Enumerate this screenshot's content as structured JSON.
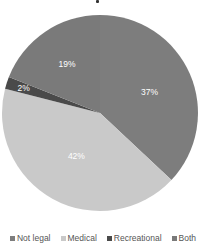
{
  "chart_data": {
    "type": "pie",
    "title": "",
    "categories": [
      "Not legal",
      "Medical",
      "Recreational",
      "Both"
    ],
    "values": [
      37,
      42,
      2,
      19
    ],
    "labels": [
      "37%",
      "42%",
      "2%",
      "19%"
    ],
    "colors": [
      "#7d7d7d",
      "#c9c9c9",
      "#4a4a4a",
      "#7a7a7a"
    ],
    "start_angle_deg": 0,
    "direction": "clockwise",
    "legend_position": "bottom",
    "data_labels": "inside",
    "series_mapping_note": "Medical (lightest) and Recreational (darkest) read directly from tone. Not legal vs. Both is inferred from clockwise legend order — the two slices are nearly identical mid-gray with no visible boundary, and the legend swatches are too small to distinguish them."
  },
  "legend": {
    "items": [
      {
        "label": "Not legal",
        "color": "#7d7d7d"
      },
      {
        "label": "Medical",
        "color": "#c9c9c9"
      },
      {
        "label": "Recreational",
        "color": "#4a4a4a"
      },
      {
        "label": "Both",
        "color": "#7a7a7a"
      }
    ]
  }
}
